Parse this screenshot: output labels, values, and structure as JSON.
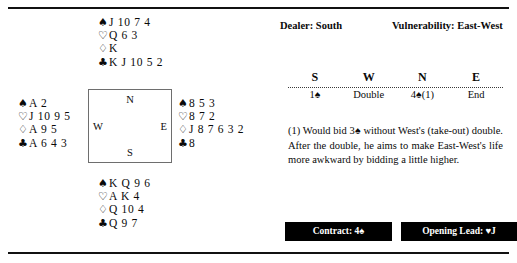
{
  "suits": {
    "spade": "♠",
    "heart": "♡",
    "diamond": "♢",
    "club": "♣",
    "heart_solid": "♥",
    "spade_solid": "♠",
    "club_solid": "♣"
  },
  "deal": {
    "north": {
      "label": "North",
      "spades": "J 10 7 4",
      "hearts": "Q 6 3",
      "diamonds": "K",
      "clubs": "K J 10 5 2"
    },
    "west": {
      "label": "West",
      "spades": "A 2",
      "hearts": "J 10 9 5",
      "diamonds": "A 9 5",
      "clubs": "A 6 4 3"
    },
    "east": {
      "label": "East",
      "spades": "8 5 3",
      "hearts": "8 7 2",
      "diamonds": "J 8 7 6 3 2",
      "clubs": "8"
    },
    "south": {
      "label": "South",
      "spades": "K Q 9 6",
      "hearts": "A K 4",
      "diamonds": "Q 10 4",
      "clubs": "Q 9 7"
    },
    "compass": {
      "north": "N",
      "south": "S",
      "west": "W",
      "east": "E"
    }
  },
  "header": {
    "dealer": "Dealer: South",
    "vulnerability": "Vulnerability: East-West"
  },
  "auction": {
    "columns": [
      "S",
      "W",
      "N",
      "E"
    ],
    "bids": [
      "1♠",
      "Double",
      "4♠(1)",
      "End"
    ]
  },
  "note": "(1) Would bid 3♠ without West's (take-out) double. After the double, he aims to make East-West's life more awkward by bidding a little higher.",
  "footer": {
    "contract": "Contract: 4♠",
    "opening_lead": "Opening Lead: ♥J"
  }
}
